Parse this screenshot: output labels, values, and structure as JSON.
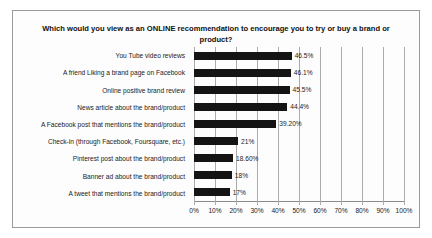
{
  "chart": {
    "title": "Which would you view as an ONLINE recommendation to encourage you to try or buy a brand or product?"
  },
  "chart_data": {
    "type": "bar",
    "orientation": "horizontal",
    "title": "Which would you view as an ONLINE recommendation to encourage you to try or buy a brand or product?",
    "categories": [
      "You Tube video reviews",
      "A friend Liking a brand page on Facebook",
      "Online positive brand review",
      "News article about the brand/product",
      "A Facebook post that mentions the brand/product",
      "Check-in (through Facebook, Foursquare, etc.)",
      "Pinterest post about the brand/product",
      "Banner ad about the brand/product",
      "A tweet that mentions the brand/product"
    ],
    "values": [
      46.5,
      46.1,
      45.5,
      44.4,
      39.2,
      21,
      18.6,
      18,
      17
    ],
    "value_labels": [
      "46.5%",
      "46.1%",
      "45.5%",
      "44.4%",
      "39.20%",
      "21%",
      "18.60%",
      "18%",
      "17%"
    ],
    "xlabel": "",
    "ylabel": "",
    "xlim": [
      0,
      100
    ],
    "x_ticks": [
      "0%",
      "10%",
      "20%",
      "30%",
      "40%",
      "50%",
      "60%",
      "70%",
      "80%",
      "90%",
      "100%"
    ],
    "grid": "vertical-gridlines-on",
    "legend": "none",
    "bar_color": "#141414",
    "gridline_color": "#ababab",
    "border_color": "#9a9a9a"
  }
}
